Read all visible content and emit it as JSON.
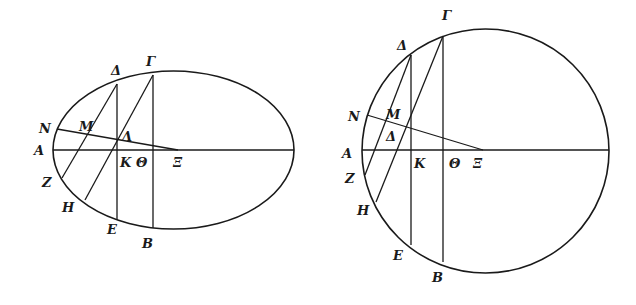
{
  "figures": [
    {
      "name": "ellipse-figure",
      "shape": "ellipse",
      "labels": {
        "A": "A",
        "B": "B",
        "G": "Γ",
        "D": "Δ",
        "E": "E",
        "Z": "Z",
        "H": "H",
        "Th": "Θ",
        "K": "K",
        "L": "Λ",
        "M": "M",
        "N": "N",
        "X": "Ξ"
      }
    },
    {
      "name": "circle-figure",
      "shape": "circle",
      "labels": {
        "A": "A",
        "B": "B",
        "G": "Γ",
        "D": "Δ",
        "D2": "Δ",
        "E": "E",
        "Z": "Z",
        "H": "H",
        "Th": "Θ",
        "K": "K",
        "M": "M",
        "N": "N",
        "X": "Ξ"
      }
    }
  ]
}
